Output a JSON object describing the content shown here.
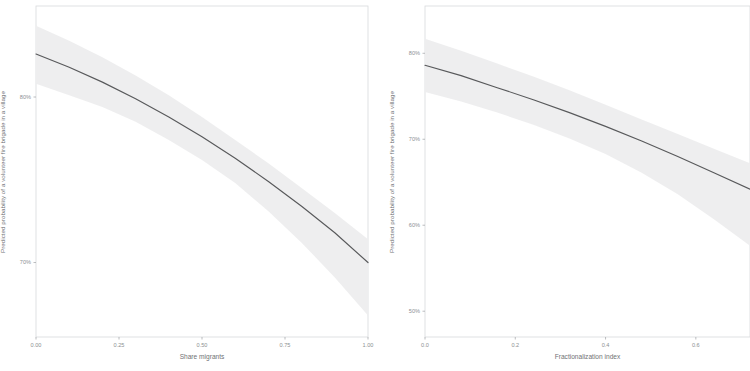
{
  "figure": {
    "background_color": "#ffffff",
    "panel_border_color": "#d8dadc",
    "line_color": "#58595b",
    "band_color": "#ededee",
    "tick_color": "#9fa2a5",
    "axis_text_color": "#8d9093",
    "axis_title_color": "#6f7275"
  },
  "chart_data": [
    {
      "type": "line",
      "panel": "left",
      "title": "",
      "xlabel": "Share migrants",
      "ylabel": "Predicted probability of a volunteer fire brigade in a village",
      "xlim": [
        0.0,
        1.0
      ],
      "ylim": [
        0.655,
        0.855
      ],
      "grid": false,
      "legend": false,
      "xticks": [
        0.0,
        0.25,
        0.5,
        0.75,
        1.0
      ],
      "xticklabels": [
        "0.00",
        "0.25",
        "0.50",
        "0.75",
        "1.00"
      ],
      "yticks": [
        0.7,
        0.8
      ],
      "yticklabels": [
        "70%",
        "80%"
      ],
      "x": [
        0.0,
        0.1,
        0.2,
        0.3,
        0.4,
        0.5,
        0.6,
        0.7,
        0.8,
        0.9,
        1.0
      ],
      "series": [
        {
          "name": "Predicted probability",
          "values": [
            0.826,
            0.818,
            0.809,
            0.799,
            0.788,
            0.776,
            0.763,
            0.749,
            0.734,
            0.718,
            0.7
          ]
        }
      ],
      "confidence_band": {
        "name": "95% confidence interval",
        "upper": [
          0.843,
          0.834,
          0.824,
          0.813,
          0.801,
          0.788,
          0.774,
          0.76,
          0.745,
          0.73,
          0.714
        ],
        "lower": [
          0.808,
          0.801,
          0.794,
          0.785,
          0.774,
          0.762,
          0.748,
          0.731,
          0.712,
          0.691,
          0.668
        ]
      }
    },
    {
      "type": "line",
      "panel": "right",
      "title": "",
      "xlabel": "Fractionalization index",
      "ylabel": "Predicted probability of a volunteer fire brigade in a village",
      "xlim": [
        0.0,
        0.72
      ],
      "ylim": [
        0.47,
        0.855
      ],
      "grid": false,
      "legend": false,
      "xticks": [
        0.0,
        0.2,
        0.4,
        0.6
      ],
      "xticklabels": [
        "0.0",
        "0.2",
        "0.4",
        "0.6"
      ],
      "yticks": [
        0.5,
        0.6,
        0.7,
        0.8
      ],
      "yticklabels": [
        "50%",
        "60%",
        "70%",
        "80%"
      ],
      "x": [
        0.0,
        0.08,
        0.16,
        0.24,
        0.32,
        0.4,
        0.48,
        0.56,
        0.64,
        0.72
      ],
      "series": [
        {
          "name": "Predicted probability",
          "values": [
            0.786,
            0.774,
            0.76,
            0.746,
            0.731,
            0.715,
            0.698,
            0.68,
            0.661,
            0.642
          ]
        }
      ],
      "confidence_band": {
        "name": "95% confidence interval",
        "upper": [
          0.817,
          0.803,
          0.788,
          0.773,
          0.757,
          0.74,
          0.723,
          0.706,
          0.689,
          0.672
        ],
        "lower": [
          0.755,
          0.744,
          0.731,
          0.717,
          0.701,
          0.683,
          0.661,
          0.636,
          0.607,
          0.576
        ]
      }
    }
  ]
}
